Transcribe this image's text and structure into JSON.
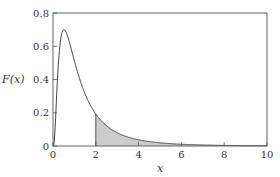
{
  "chart_data": {
    "type": "line",
    "title": "",
    "xlabel": "x",
    "ylabel": "F(x)",
    "xlim": [
      0,
      10
    ],
    "ylim": [
      0,
      0.8
    ],
    "xticks": [
      "0",
      "2",
      "4",
      "6",
      "8",
      "10"
    ],
    "yticks": [
      "0",
      "0.2",
      "0.4",
      "0.6",
      "0.8"
    ],
    "grid": false,
    "legend": null,
    "series": [
      {
        "name": "F(x)",
        "x": [
          0,
          0.1,
          0.2,
          0.3,
          0.4,
          0.5,
          0.6,
          0.8,
          1.0,
          1.2,
          1.5,
          2.0,
          2.5,
          3.0,
          4.0,
          5.0,
          6.0,
          7.0,
          8.0,
          9.0,
          10.0
        ],
        "values": [
          0,
          0.25,
          0.52,
          0.65,
          0.69,
          0.7,
          0.69,
          0.63,
          0.54,
          0.45,
          0.33,
          0.2,
          0.13,
          0.09,
          0.045,
          0.025,
          0.015,
          0.009,
          0.006,
          0.004,
          0.003
        ]
      }
    ],
    "annotations": [
      {
        "type": "shaded_area",
        "from_x": 2,
        "to_x": 10,
        "color": "#cccccc",
        "description": "Area under curve for x >= 2"
      }
    ]
  },
  "axes": {
    "xlabel": "x",
    "ylabel": "F(x)",
    "xticks": [
      "0",
      "2",
      "4",
      "6",
      "8",
      "10"
    ],
    "yticks": [
      "0",
      "0.2",
      "0.4",
      "0.6",
      "0.8"
    ]
  }
}
